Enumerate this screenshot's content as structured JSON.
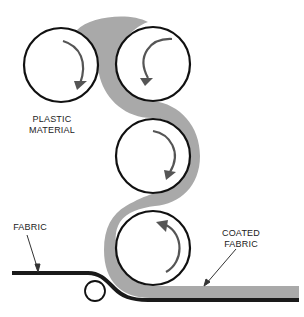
{
  "diagram": {
    "labels": {
      "plastic_line1": "PLASTIC",
      "plastic_line2": "MATERIAL",
      "fabric": "FABRIC",
      "coated_line1": "COATED",
      "coated_line2": "FABRIC"
    },
    "colors": {
      "plastic": "#a9a9a9",
      "fabric": "#1a1a1a",
      "roller_stroke": "#111111",
      "arrow": "#555555"
    },
    "rollers": [
      {
        "name": "roller-1",
        "cx": 61,
        "cy": 65,
        "r": 37,
        "rotation": "clockwise"
      },
      {
        "name": "roller-2",
        "cx": 153,
        "cy": 64,
        "r": 37,
        "rotation": "counterclockwise"
      },
      {
        "name": "roller-3",
        "cx": 153,
        "cy": 156,
        "r": 37,
        "rotation": "clockwise"
      },
      {
        "name": "roller-4",
        "cx": 153,
        "cy": 248,
        "r": 37,
        "rotation": "counterclockwise"
      },
      {
        "name": "guide-roller",
        "cx": 95,
        "cy": 291,
        "r": 10
      }
    ]
  }
}
